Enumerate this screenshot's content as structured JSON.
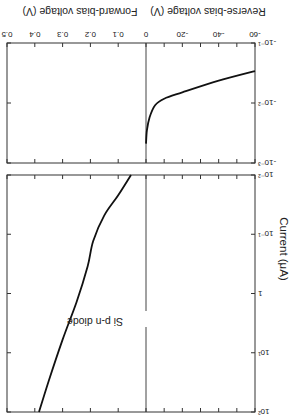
{
  "chart_data": {
    "type": "line",
    "title": "",
    "annotation": "Si p-n diode",
    "orientation": "figure rendered rotated 180 degrees",
    "xlabel_forward": "Forward-bias voltage (V)",
    "xlabel_reverse": "Reverse-bias voltage (V)",
    "ylabel": "Current (μA)",
    "grid": false,
    "x_ticks": [
      {
        "label": "0.5",
        "v": 0.5
      },
      {
        "label": "0.4",
        "v": 0.4
      },
      {
        "label": "0.3",
        "v": 0.3
      },
      {
        "label": "0.2",
        "v": 0.2
      },
      {
        "label": "0.1",
        "v": 0.1
      },
      {
        "label": "0",
        "v": 0
      },
      {
        "label": "-20",
        "v": -20
      },
      {
        "label": "-40",
        "v": -40
      },
      {
        "label": "-60",
        "v": -60
      }
    ],
    "x_minor_ticks_reverse": [
      -10,
      -30,
      -50
    ],
    "panels": [
      {
        "name": "forward",
        "yscale": "log",
        "ylim": [
          0.01,
          100
        ],
        "y_ticks": [
          {
            "label": "10⁻²",
            "exp": -2
          },
          {
            "label": "10⁻¹",
            "exp": -1
          },
          {
            "label": "1",
            "exp": 0
          },
          {
            "label": "10¹",
            "exp": 1
          },
          {
            "label": "10²",
            "exp": 2
          }
        ],
        "xlim": [
          0.5,
          0
        ],
        "series": [
          {
            "name": "Forward current",
            "points": [
              {
                "v": 0.054,
                "i": 0.01
              },
              {
                "v": 0.1,
                "i": 0.022
              },
              {
                "v": 0.15,
                "i": 0.048
              },
              {
                "v": 0.19,
                "i": 0.13
              },
              {
                "v": 0.21,
                "i": 0.35
              },
              {
                "v": 0.25,
                "i": 1.4
              },
              {
                "v": 0.3,
                "i": 6.0
              },
              {
                "v": 0.35,
                "i": 30
              },
              {
                "v": 0.385,
                "i": 100
              }
            ]
          }
        ]
      },
      {
        "name": "reverse",
        "yscale": "log",
        "ylim": [
          -0.001,
          -0.1
        ],
        "y_ticks": [
          {
            "label": "-10⁻³",
            "exp": -3
          },
          {
            "label": "-10⁻²",
            "exp": -2
          },
          {
            "label": "-10⁻¹",
            "exp": -1
          }
        ],
        "xlim": [
          0,
          -60
        ],
        "series": [
          {
            "name": "Reverse current",
            "points": [
              {
                "v": 0,
                "i": -0.0021
              },
              {
                "v": -0.5,
                "i": -0.0035
              },
              {
                "v": -2,
                "i": -0.0058
              },
              {
                "v": -5,
                "i": -0.0092
              },
              {
                "v": -10,
                "i": -0.0118
              },
              {
                "v": -20,
                "i": -0.015
              },
              {
                "v": -40,
                "i": -0.0235
              },
              {
                "v": -60,
                "i": -0.034
              }
            ]
          }
        ]
      }
    ]
  }
}
